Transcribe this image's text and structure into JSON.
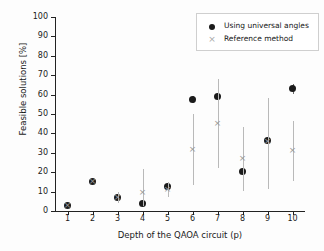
{
  "chart_data": {
    "type": "scatter",
    "title": "",
    "xlabel": "Depth of the QAOA circuit (p)",
    "ylabel": "Feasible solutions [%]",
    "x": [
      1,
      2,
      3,
      4,
      5,
      6,
      7,
      8,
      9,
      10
    ],
    "xticklabels": [
      "1",
      "2",
      "3",
      "4",
      "5",
      "6",
      "7",
      "8",
      "9",
      "10"
    ],
    "yticklabels": [
      "0",
      "10",
      "20",
      "30",
      "40",
      "50",
      "60",
      "70",
      "80",
      "90",
      "100"
    ],
    "xlim": [
      0.5,
      10.5
    ],
    "ylim": [
      0,
      100
    ],
    "grid": false,
    "legend_position": "upper right",
    "series": [
      {
        "name": "Using universal angles",
        "marker": "filled-circle",
        "color": "#1b1b1b",
        "values": [
          3,
          15,
          7,
          4,
          12.5,
          57.5,
          59,
          20.5,
          36.5,
          63
        ],
        "err_low": [
          3,
          15,
          5.5,
          2.5,
          10.5,
          55.5,
          56.5,
          18.5,
          34,
          60.5
        ],
        "err_high": [
          3,
          15,
          8.5,
          5.5,
          14.5,
          59.5,
          61.5,
          22.5,
          39,
          65.5
        ]
      },
      {
        "name": "Reference method",
        "marker": "cross",
        "color": "#9a9a9a",
        "values": [
          3,
          15,
          7,
          9.5,
          11,
          31.5,
          45,
          27,
          36,
          31
        ],
        "err_low": [
          3,
          15,
          4,
          2.5,
          7,
          13.5,
          22,
          10.5,
          11.5,
          15.5
        ],
        "err_high": [
          3,
          15,
          10,
          21.5,
          15,
          50,
          68,
          43.5,
          58,
          46.5
        ]
      }
    ]
  },
  "legend": {
    "entries": [
      {
        "label": "Using universal angles",
        "marker": "legend-dot-marker"
      },
      {
        "label": "Reference method",
        "marker": "legend-cross-marker"
      }
    ]
  }
}
